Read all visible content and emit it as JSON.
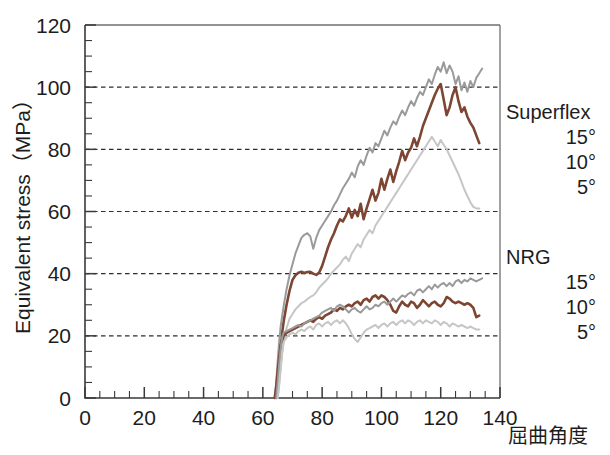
{
  "chart_data": {
    "type": "line",
    "title": "",
    "xlabel": "屈曲角度",
    "ylabel": "Equivalent stress（MPa）",
    "xlim": [
      0,
      140
    ],
    "ylim": [
      0,
      120
    ],
    "xticks": [
      0,
      20,
      40,
      60,
      80,
      100,
      120,
      140
    ],
    "yticks": [
      0,
      20,
      40,
      60,
      80,
      100,
      120
    ],
    "x_minor_step": 5,
    "y_minor_step": 5,
    "grid": "horizontal-dashed",
    "gridlines_at": [
      20,
      40,
      60,
      80,
      100
    ],
    "legend_position": "right-outside",
    "legend_groups": [
      {
        "name": "Superflex",
        "entries": [
          {
            "label": "15°",
            "color": "#7d4633"
          },
          {
            "label": "10°",
            "color": "#9a9a9a"
          },
          {
            "label": "5°",
            "color": "#c6c6c6"
          }
        ]
      },
      {
        "name": "NRG",
        "entries": [
          {
            "label": "15°",
            "color": "#7d4633"
          },
          {
            "label": "10°",
            "color": "#9a9a9a"
          },
          {
            "label": "5°",
            "color": "#c6c6c6"
          }
        ]
      }
    ],
    "series": [
      {
        "name": "Superflex 15°",
        "group": "Superflex",
        "angle": "15°",
        "color": "#7d4633",
        "width": 2.6,
        "x": [
          64.5,
          65.0,
          65.5,
          66.0,
          66.5,
          67.0,
          68.0,
          69.0,
          70.0,
          71.0,
          72.0,
          73.0,
          74.0,
          75.0,
          76.0,
          77.0,
          78.0,
          79.0,
          80.0,
          81.0,
          82.0,
          83.0,
          84.0,
          85.0,
          86.0,
          87.0,
          88.0,
          89.0,
          90.0,
          91.0,
          92.0,
          93.0,
          94.0,
          95.0,
          96.0,
          97.0,
          98.0,
          99.0,
          100.0,
          101.0,
          102.0,
          103.0,
          104.0,
          105.0,
          106.0,
          107.0,
          108.0,
          109.0,
          110.0,
          111.0,
          112.0,
          113.0,
          114.0,
          115.0,
          116.0,
          117.0,
          118.0,
          119.0,
          120.0,
          121.0,
          122.0,
          123.0,
          124.0,
          125.0,
          126.0,
          127.0,
          128.0,
          129.0,
          130.0,
          131.0,
          132.0,
          133.0
        ],
        "y": [
          0.0,
          4.0,
          10.0,
          16.0,
          21.0,
          24.5,
          30.0,
          34.5,
          38.0,
          39.5,
          40.3,
          40.6,
          40.2,
          40.5,
          40.6,
          40.0,
          39.6,
          40.4,
          42.5,
          45.5,
          48.5,
          51.0,
          53.0,
          55.5,
          57.5,
          56.8,
          58.6,
          61.0,
          58.0,
          60.5,
          58.5,
          62.5,
          57.5,
          61.0,
          64.0,
          67.0,
          63.5,
          66.0,
          70.5,
          67.0,
          70.5,
          73.5,
          69.5,
          73.0,
          76.0,
          79.5,
          76.5,
          79.0,
          80.5,
          83.5,
          81.0,
          84.0,
          87.5,
          90.0,
          92.5,
          95.0,
          97.5,
          99.5,
          101.0,
          96.0,
          91.0,
          93.5,
          97.5,
          100.0,
          95.5,
          92.0,
          93.5,
          90.5,
          88.5,
          87.0,
          84.5,
          82.0
        ]
      },
      {
        "name": "Superflex 10°",
        "group": "Superflex",
        "angle": "10°",
        "color": "#9a9a9a",
        "width": 2.0,
        "x": [
          64.0,
          64.5,
          65.0,
          65.5,
          66.0,
          67.0,
          68.0,
          69.0,
          70.0,
          71.0,
          72.0,
          73.0,
          74.0,
          75.0,
          76.0,
          77.0,
          78.0,
          79.0,
          80.0,
          81.0,
          82.0,
          83.0,
          84.0,
          85.0,
          86.0,
          87.0,
          88.0,
          89.0,
          90.0,
          91.0,
          92.0,
          93.0,
          94.0,
          95.0,
          96.0,
          97.0,
          98.0,
          99.0,
          100.0,
          101.0,
          102.0,
          103.0,
          104.0,
          105.0,
          106.0,
          107.0,
          108.0,
          109.0,
          110.0,
          111.0,
          112.0,
          113.0,
          114.0,
          115.0,
          116.0,
          117.0,
          118.0,
          119.0,
          120.0,
          121.0,
          122.0,
          123.0,
          124.0,
          125.0,
          126.0,
          127.0,
          128.0,
          129.0,
          130.0,
          131.0,
          132.0,
          133.0,
          134.0
        ],
        "y": [
          0.0,
          5.0,
          12.0,
          18.0,
          23.0,
          29.5,
          35.0,
          39.5,
          43.0,
          46.5,
          49.0,
          51.5,
          52.5,
          53.0,
          52.0,
          48.0,
          51.5,
          54.0,
          55.5,
          57.0,
          58.5,
          60.0,
          62.0,
          63.5,
          65.5,
          67.5,
          69.0,
          70.5,
          72.5,
          71.0,
          74.5,
          76.5,
          75.0,
          78.0,
          80.5,
          79.0,
          82.0,
          81.0,
          83.5,
          86.0,
          84.5,
          87.0,
          89.0,
          88.0,
          90.5,
          92.5,
          91.0,
          93.5,
          95.5,
          94.0,
          96.5,
          98.5,
          97.5,
          100.0,
          102.5,
          101.0,
          104.0,
          106.5,
          105.0,
          108.0,
          104.5,
          107.0,
          105.0,
          101.0,
          103.5,
          99.0,
          101.5,
          98.5,
          102.0,
          100.0,
          103.0,
          104.5,
          106.0
        ]
      },
      {
        "name": "Superflex 5°",
        "group": "Superflex",
        "angle": "5°",
        "color": "#c6c6c6",
        "width": 2.0,
        "x": [
          65.0,
          65.5,
          66.0,
          66.5,
          67.0,
          68.0,
          69.0,
          70.0,
          71.0,
          72.0,
          73.0,
          74.0,
          75.0,
          76.0,
          77.0,
          78.0,
          79.0,
          80.0,
          81.0,
          82.0,
          83.0,
          84.0,
          85.0,
          86.0,
          87.0,
          88.0,
          89.0,
          90.0,
          91.0,
          92.0,
          93.0,
          94.0,
          95.0,
          96.0,
          97.0,
          98.0,
          99.0,
          100.0,
          101.0,
          102.0,
          103.0,
          104.0,
          105.0,
          106.0,
          107.0,
          108.0,
          109.0,
          110.0,
          111.0,
          112.0,
          113.0,
          114.0,
          115.0,
          116.0,
          117.0,
          118.0,
          119.0,
          120.0,
          121.0,
          122.0,
          123.0,
          124.0,
          125.0,
          126.0,
          127.0,
          128.0,
          129.0,
          130.0,
          131.0,
          132.0,
          133.0
        ],
        "y": [
          0.0,
          4.0,
          9.0,
          14.0,
          18.0,
          22.5,
          25.5,
          27.0,
          28.5,
          29.5,
          30.5,
          31.0,
          31.8,
          32.5,
          33.0,
          34.0,
          35.5,
          36.5,
          37.5,
          38.5,
          40.0,
          41.0,
          42.0,
          43.0,
          44.5,
          45.5,
          44.0,
          46.5,
          48.0,
          49.5,
          48.5,
          51.0,
          52.5,
          54.0,
          53.0,
          55.5,
          57.0,
          58.5,
          60.0,
          61.5,
          63.0,
          64.5,
          66.0,
          67.5,
          69.0,
          70.5,
          72.0,
          73.5,
          75.0,
          76.5,
          78.0,
          79.5,
          81.0,
          82.5,
          84.0,
          82.5,
          81.0,
          83.0,
          81.5,
          80.0,
          78.0,
          76.0,
          74.0,
          72.0,
          69.5,
          67.0,
          65.0,
          63.0,
          61.5,
          61.0,
          61.0
        ]
      },
      {
        "name": "NRG 15°",
        "group": "NRG",
        "angle": "15°",
        "color": "#7d4633",
        "width": 2.6,
        "x": [
          64.0,
          64.5,
          65.0,
          65.5,
          66.0,
          67.0,
          68.0,
          69.0,
          70.0,
          71.0,
          72.0,
          73.0,
          74.0,
          75.0,
          76.0,
          77.0,
          78.0,
          79.0,
          80.0,
          81.0,
          82.0,
          83.0,
          84.0,
          85.0,
          86.0,
          87.0,
          88.0,
          89.0,
          90.0,
          91.0,
          92.0,
          93.0,
          94.0,
          95.0,
          96.0,
          97.0,
          98.0,
          99.0,
          100.0,
          101.0,
          102.0,
          103.0,
          104.0,
          105.0,
          106.0,
          107.0,
          108.0,
          109.0,
          110.0,
          111.0,
          112.0,
          113.0,
          114.0,
          115.0,
          116.0,
          117.0,
          118.0,
          119.0,
          120.0,
          121.0,
          122.0,
          123.0,
          124.0,
          125.0,
          126.0,
          127.0,
          128.0,
          129.0,
          130.0,
          131.0,
          132.0,
          133.0
        ],
        "y": [
          0.0,
          3.5,
          8.5,
          13.0,
          17.0,
          20.0,
          21.0,
          21.5,
          22.0,
          22.5,
          23.0,
          23.5,
          24.0,
          24.5,
          25.0,
          24.5,
          25.5,
          26.0,
          25.5,
          26.5,
          27.0,
          27.5,
          28.5,
          28.0,
          29.0,
          28.5,
          29.5,
          30.0,
          29.5,
          30.5,
          31.0,
          30.0,
          31.5,
          32.0,
          31.0,
          32.5,
          33.0,
          32.0,
          33.0,
          32.5,
          31.5,
          30.0,
          28.0,
          27.5,
          29.5,
          31.0,
          30.0,
          29.5,
          31.0,
          30.5,
          29.0,
          30.0,
          31.5,
          30.5,
          29.5,
          30.5,
          31.0,
          30.0,
          29.5,
          30.5,
          32.5,
          32.0,
          31.0,
          30.5,
          31.0,
          30.5,
          30.0,
          30.5,
          30.0,
          29.0,
          26.0,
          26.5
        ]
      },
      {
        "name": "NRG 10°",
        "group": "NRG",
        "angle": "10°",
        "color": "#9a9a9a",
        "width": 2.0,
        "x": [
          64.5,
          65.0,
          65.5,
          66.0,
          66.5,
          67.0,
          68.0,
          69.0,
          70.0,
          71.0,
          72.0,
          73.0,
          74.0,
          75.0,
          76.0,
          77.0,
          78.0,
          79.0,
          80.0,
          81.0,
          82.0,
          83.0,
          84.0,
          85.0,
          86.0,
          87.0,
          88.0,
          89.0,
          90.0,
          91.0,
          92.0,
          93.0,
          94.0,
          95.0,
          96.0,
          97.0,
          98.0,
          99.0,
          100.0,
          101.0,
          102.0,
          103.0,
          104.0,
          105.0,
          106.0,
          107.0,
          108.0,
          109.0,
          110.0,
          111.0,
          112.0,
          113.0,
          114.0,
          115.0,
          116.0,
          117.0,
          118.0,
          119.0,
          120.0,
          121.0,
          122.0,
          123.0,
          124.0,
          125.0,
          126.0,
          127.0,
          128.0,
          129.0,
          130.0,
          131.0,
          132.0,
          133.0,
          134.0
        ],
        "y": [
          0.0,
          5.0,
          11.0,
          16.0,
          19.5,
          21.0,
          21.5,
          22.0,
          22.5,
          23.0,
          23.5,
          23.0,
          24.0,
          24.5,
          25.0,
          25.5,
          26.0,
          26.5,
          27.5,
          28.0,
          28.5,
          29.0,
          28.0,
          29.5,
          30.0,
          29.5,
          28.5,
          27.5,
          28.5,
          29.0,
          28.0,
          27.5,
          28.5,
          29.5,
          28.5,
          29.0,
          30.0,
          29.5,
          30.5,
          31.0,
          30.0,
          31.0,
          32.0,
          31.0,
          32.0,
          33.0,
          32.5,
          33.5,
          34.0,
          33.0,
          34.5,
          35.0,
          34.0,
          35.0,
          36.0,
          35.0,
          36.5,
          35.5,
          36.5,
          37.0,
          36.0,
          37.0,
          36.0,
          37.5,
          38.0,
          37.0,
          38.0,
          37.5,
          38.5,
          38.0,
          37.5,
          38.0,
          38.5
        ]
      },
      {
        "name": "NRG 5°",
        "group": "NRG",
        "angle": "5°",
        "color": "#c6c6c6",
        "width": 2.0,
        "x": [
          65.0,
          65.5,
          66.0,
          66.5,
          67.0,
          68.0,
          69.0,
          70.0,
          71.0,
          72.0,
          73.0,
          74.0,
          75.0,
          76.0,
          77.0,
          78.0,
          79.0,
          80.0,
          81.0,
          82.0,
          83.0,
          84.0,
          85.0,
          86.0,
          87.0,
          88.0,
          89.0,
          90.0,
          91.0,
          92.0,
          93.0,
          94.0,
          95.0,
          96.0,
          97.0,
          98.0,
          99.0,
          100.0,
          101.0,
          102.0,
          103.0,
          104.0,
          105.0,
          106.0,
          107.0,
          108.0,
          109.0,
          110.0,
          111.0,
          112.0,
          113.0,
          114.0,
          115.0,
          116.0,
          117.0,
          118.0,
          119.0,
          120.0,
          121.0,
          122.0,
          123.0,
          124.0,
          125.0,
          126.0,
          127.0,
          128.0,
          129.0,
          130.0,
          131.0,
          132.0,
          133.0
        ],
        "y": [
          0.0,
          4.5,
          10.0,
          15.0,
          18.0,
          19.5,
          20.5,
          21.0,
          20.5,
          21.5,
          22.0,
          21.5,
          22.5,
          23.0,
          22.0,
          23.5,
          24.0,
          23.0,
          24.0,
          24.5,
          23.5,
          24.5,
          25.0,
          24.0,
          25.0,
          24.0,
          22.5,
          20.5,
          19.0,
          18.0,
          19.5,
          21.0,
          22.0,
          22.5,
          23.0,
          23.5,
          22.5,
          23.5,
          24.0,
          23.0,
          24.0,
          24.5,
          23.5,
          24.5,
          25.0,
          24.0,
          25.0,
          24.5,
          23.5,
          24.5,
          25.0,
          24.0,
          25.0,
          24.5,
          24.0,
          25.0,
          24.5,
          23.5,
          24.5,
          24.0,
          23.0,
          24.0,
          23.5,
          23.0,
          23.5,
          23.0,
          22.5,
          23.0,
          22.5,
          22.0,
          22.0
        ]
      }
    ]
  }
}
